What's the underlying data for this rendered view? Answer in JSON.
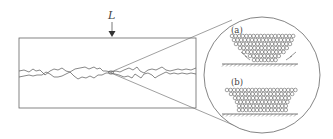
{
  "diagram": {
    "load_label": "L",
    "panel_a_label": "(a)",
    "panel_b_label": "(b)",
    "colors": {
      "stroke": "#555555",
      "line": "#777777",
      "background": "#ffffff"
    },
    "specimen": {
      "x": 19,
      "y": 38,
      "width": 177,
      "height": 70
    },
    "magnifier": {
      "cx": 262,
      "cy": 75,
      "r": 58
    },
    "focus_point": {
      "x": 111,
      "y": 72
    },
    "panel_a": {
      "rows": [
        {
          "y": 36,
          "x_start": 232,
          "count": 18
        },
        {
          "y": 40,
          "x_start": 234,
          "count": 17
        },
        {
          "y": 44,
          "x_start": 236,
          "count": 16
        },
        {
          "y": 48,
          "x_start": 240,
          "count": 14
        },
        {
          "y": 52,
          "x_start": 244,
          "count": 12
        },
        {
          "y": 56,
          "x_start": 250,
          "count": 9
        },
        {
          "y": 60,
          "x_start": 254,
          "count": 7
        }
      ],
      "ground_y": 64,
      "ground_x1": 222,
      "ground_x2": 298
    },
    "panel_b": {
      "rows": [
        {
          "y": 90,
          "x_start": 227,
          "count": 20
        },
        {
          "y": 94,
          "x_start": 231,
          "count": 18
        },
        {
          "y": 98,
          "x_start": 235,
          "count": 16
        },
        {
          "y": 102,
          "x_start": 237,
          "count": 15
        },
        {
          "y": 106,
          "x_start": 239,
          "count": 14
        },
        {
          "y": 110,
          "x_start": 239,
          "count": 14
        }
      ],
      "ground_y": 114,
      "ground_x1": 222,
      "ground_x2": 298
    },
    "atom_spacing": 3.6,
    "atom_radius": 1.8
  }
}
